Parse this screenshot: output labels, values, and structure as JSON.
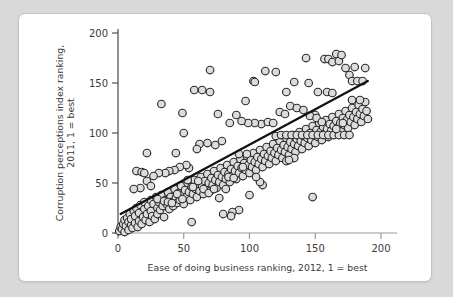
{
  "chart_data": {
    "type": "scatter",
    "title": "",
    "xlabel": "Ease of doing business ranking, 2012, 1 = best",
    "ylabel": "Corruption perceptions index ranking,\n2011, 1 = best",
    "ylabel_line1": "Corruption perceptions index ranking,",
    "ylabel_line2": "2011, 1 = best",
    "xlim": [
      0,
      200
    ],
    "ylim": [
      0,
      200
    ],
    "xticks": [
      0,
      50,
      100,
      150,
      200
    ],
    "yticks": [
      0,
      50,
      100,
      150,
      200
    ],
    "xtick_labels": [
      "0",
      "50",
      "100",
      "150",
      "200"
    ],
    "ytick_labels": [
      "0",
      "50",
      "100",
      "150",
      "200"
    ],
    "grid": false,
    "legend": "none",
    "marker": {
      "shape": "circle",
      "fill_color": "#dcdcdc",
      "edge_color": "#2b2b2b",
      "size_px": 7.6
    },
    "trendline": {
      "type": "linear-fit",
      "color": "#111111",
      "x_start": 2,
      "y_start": 19,
      "x_end": 190,
      "y_end": 152,
      "slope": 0.707,
      "intercept": 17.6
    },
    "points": [
      [
        1,
        2
      ],
      [
        2,
        6
      ],
      [
        3,
        4
      ],
      [
        4,
        9
      ],
      [
        5,
        1
      ],
      [
        5,
        13
      ],
      [
        6,
        7
      ],
      [
        7,
        15
      ],
      [
        8,
        3
      ],
      [
        8,
        11
      ],
      [
        9,
        19
      ],
      [
        10,
        8
      ],
      [
        10,
        14
      ],
      [
        11,
        5
      ],
      [
        12,
        22
      ],
      [
        13,
        10
      ],
      [
        13,
        17
      ],
      [
        14,
        25
      ],
      [
        15,
        6
      ],
      [
        16,
        12
      ],
      [
        16,
        20
      ],
      [
        17,
        28
      ],
      [
        18,
        9
      ],
      [
        19,
        16
      ],
      [
        20,
        24
      ],
      [
        20,
        31
      ],
      [
        21,
        13
      ],
      [
        22,
        19
      ],
      [
        23,
        27
      ],
      [
        24,
        11
      ],
      [
        25,
        33
      ],
      [
        25,
        22
      ],
      [
        26,
        17
      ],
      [
        27,
        29
      ],
      [
        28,
        14
      ],
      [
        29,
        36
      ],
      [
        30,
        25
      ],
      [
        30,
        19
      ],
      [
        31,
        31
      ],
      [
        32,
        23
      ],
      [
        33,
        38
      ],
      [
        34,
        27
      ],
      [
        35,
        16
      ],
      [
        36,
        33
      ],
      [
        37,
        29
      ],
      [
        38,
        41
      ],
      [
        39,
        24
      ],
      [
        40,
        36
      ],
      [
        41,
        31
      ],
      [
        42,
        27
      ],
      [
        43,
        44
      ],
      [
        44,
        35
      ],
      [
        45,
        30
      ],
      [
        46,
        40
      ],
      [
        47,
        33
      ],
      [
        48,
        47
      ],
      [
        49,
        38
      ],
      [
        50,
        29
      ],
      [
        51,
        43
      ],
      [
        52,
        36
      ],
      [
        53,
        50
      ],
      [
        54,
        41
      ],
      [
        55,
        33
      ],
      [
        56,
        46
      ],
      [
        57,
        39
      ],
      [
        58,
        53
      ],
      [
        59,
        44
      ],
      [
        60,
        36
      ],
      [
        61,
        49
      ],
      [
        62,
        42
      ],
      [
        63,
        56
      ],
      [
        64,
        47
      ],
      [
        65,
        39
      ],
      [
        66,
        52
      ],
      [
        67,
        45
      ],
      [
        68,
        59
      ],
      [
        69,
        50
      ],
      [
        70,
        42
      ],
      [
        71,
        55
      ],
      [
        72,
        48
      ],
      [
        73,
        62
      ],
      [
        74,
        53
      ],
      [
        75,
        45
      ],
      [
        76,
        58
      ],
      [
        77,
        51
      ],
      [
        78,
        65
      ],
      [
        79,
        56
      ],
      [
        80,
        48
      ],
      [
        81,
        61
      ],
      [
        82,
        54
      ],
      [
        83,
        68
      ],
      [
        84,
        59
      ],
      [
        85,
        51
      ],
      [
        86,
        64
      ],
      [
        87,
        57
      ],
      [
        88,
        71
      ],
      [
        89,
        62
      ],
      [
        90,
        54
      ],
      [
        91,
        67
      ],
      [
        92,
        60
      ],
      [
        93,
        74
      ],
      [
        94,
        65
      ],
      [
        95,
        57
      ],
      [
        96,
        70
      ],
      [
        97,
        63
      ],
      [
        98,
        77
      ],
      [
        99,
        68
      ],
      [
        100,
        60
      ],
      [
        101,
        73
      ],
      [
        102,
        66
      ],
      [
        103,
        80
      ],
      [
        104,
        71
      ],
      [
        105,
        63
      ],
      [
        106,
        76
      ],
      [
        107,
        69
      ],
      [
        108,
        83
      ],
      [
        109,
        74
      ],
      [
        110,
        66
      ],
      [
        111,
        79
      ],
      [
        112,
        72
      ],
      [
        113,
        86
      ],
      [
        114,
        77
      ],
      [
        115,
        69
      ],
      [
        116,
        82
      ],
      [
        117,
        75
      ],
      [
        118,
        89
      ],
      [
        119,
        80
      ],
      [
        120,
        72
      ],
      [
        121,
        85
      ],
      [
        122,
        78
      ],
      [
        123,
        92
      ],
      [
        124,
        83
      ],
      [
        125,
        75
      ],
      [
        126,
        88
      ],
      [
        127,
        81
      ],
      [
        128,
        95
      ],
      [
        129,
        86
      ],
      [
        130,
        78
      ],
      [
        131,
        91
      ],
      [
        132,
        84
      ],
      [
        133,
        98
      ],
      [
        134,
        89
      ],
      [
        135,
        81
      ],
      [
        136,
        94
      ],
      [
        137,
        87
      ],
      [
        138,
        101
      ],
      [
        139,
        92
      ],
      [
        140,
        84
      ],
      [
        141,
        97
      ],
      [
        142,
        90
      ],
      [
        143,
        104
      ],
      [
        144,
        95
      ],
      [
        145,
        87
      ],
      [
        146,
        100
      ],
      [
        147,
        93
      ],
      [
        148,
        107
      ],
      [
        149,
        98
      ],
      [
        150,
        90
      ],
      [
        151,
        103
      ],
      [
        152,
        96
      ],
      [
        153,
        110
      ],
      [
        154,
        101
      ],
      [
        155,
        93
      ],
      [
        156,
        106
      ],
      [
        157,
        99
      ],
      [
        158,
        113
      ],
      [
        159,
        104
      ],
      [
        160,
        96
      ],
      [
        161,
        109
      ],
      [
        162,
        102
      ],
      [
        163,
        116
      ],
      [
        164,
        107
      ],
      [
        165,
        99
      ],
      [
        166,
        112
      ],
      [
        167,
        105
      ],
      [
        168,
        119
      ],
      [
        169,
        110
      ],
      [
        170,
        102
      ],
      [
        171,
        115
      ],
      [
        172,
        108
      ],
      [
        173,
        122
      ],
      [
        174,
        113
      ],
      [
        175,
        105
      ],
      [
        176,
        118
      ],
      [
        177,
        111
      ],
      [
        178,
        125
      ],
      [
        179,
        116
      ],
      [
        180,
        108
      ],
      [
        181,
        121
      ],
      [
        182,
        114
      ],
      [
        183,
        128
      ],
      [
        184,
        119
      ],
      [
        185,
        111
      ],
      [
        186,
        124
      ],
      [
        187,
        117
      ],
      [
        188,
        131
      ],
      [
        189,
        122
      ],
      [
        190,
        114
      ],
      [
        33,
        129
      ],
      [
        49,
        120
      ],
      [
        50,
        100
      ],
      [
        22,
        80
      ],
      [
        44,
        80
      ],
      [
        56,
        11
      ],
      [
        58,
        143
      ],
      [
        70,
        163
      ],
      [
        64,
        143
      ],
      [
        70,
        141
      ],
      [
        76,
        119
      ],
      [
        85,
        110
      ],
      [
        90,
        118
      ],
      [
        97,
        132
      ],
      [
        103,
        152
      ],
      [
        104,
        151
      ],
      [
        112,
        162
      ],
      [
        120,
        161
      ],
      [
        128,
        141
      ],
      [
        134,
        151
      ],
      [
        143,
        175
      ],
      [
        145,
        150
      ],
      [
        152,
        141
      ],
      [
        157,
        174
      ],
      [
        160,
        174
      ],
      [
        163,
        171
      ],
      [
        166,
        179
      ],
      [
        168,
        172
      ],
      [
        170,
        178
      ],
      [
        173,
        165
      ],
      [
        176,
        158
      ],
      [
        178,
        152
      ],
      [
        180,
        166
      ],
      [
        182,
        152
      ],
      [
        184,
        133
      ],
      [
        178,
        133
      ],
      [
        188,
        165
      ],
      [
        186,
        152
      ],
      [
        159,
        141
      ],
      [
        163,
        140
      ],
      [
        150,
        118
      ],
      [
        148,
        36
      ],
      [
        134,
        75
      ],
      [
        128,
        72
      ],
      [
        130,
        73
      ],
      [
        120,
        97
      ],
      [
        124,
        98
      ],
      [
        128,
        98
      ],
      [
        132,
        98
      ],
      [
        136,
        98
      ],
      [
        140,
        98
      ],
      [
        144,
        98
      ],
      [
        148,
        98
      ],
      [
        152,
        98
      ],
      [
        156,
        98
      ],
      [
        160,
        98
      ],
      [
        164,
        98
      ],
      [
        168,
        98
      ],
      [
        172,
        98
      ],
      [
        176,
        98
      ],
      [
        110,
        48
      ],
      [
        108,
        51
      ],
      [
        105,
        56
      ],
      [
        100,
        38
      ],
      [
        92,
        23
      ],
      [
        87,
        21
      ],
      [
        86,
        17
      ],
      [
        80,
        19
      ],
      [
        77,
        35
      ],
      [
        82,
        44
      ],
      [
        84,
        56
      ],
      [
        88,
        55
      ],
      [
        95,
        66
      ],
      [
        98,
        79
      ],
      [
        92,
        79
      ],
      [
        79,
        92
      ],
      [
        74,
        88
      ],
      [
        68,
        90
      ],
      [
        62,
        89
      ],
      [
        60,
        84
      ],
      [
        54,
        65
      ],
      [
        52,
        68
      ],
      [
        47,
        66
      ],
      [
        43,
        63
      ],
      [
        39,
        62
      ],
      [
        36,
        60
      ],
      [
        31,
        60
      ],
      [
        27,
        57
      ],
      [
        22,
        52
      ],
      [
        17,
        45
      ],
      [
        12,
        44
      ],
      [
        14,
        62
      ],
      [
        18,
        61
      ],
      [
        20,
        60
      ],
      [
        25,
        47
      ],
      [
        30,
        34
      ],
      [
        35,
        32
      ],
      [
        38,
        31
      ],
      [
        41,
        30
      ],
      [
        45,
        39
      ],
      [
        49,
        34
      ],
      [
        53,
        53
      ],
      [
        57,
        46
      ],
      [
        61,
        52
      ],
      [
        65,
        44
      ],
      [
        69,
        40
      ],
      [
        73,
        44
      ],
      [
        109,
        109
      ],
      [
        114,
        111
      ],
      [
        118,
        110
      ],
      [
        123,
        121
      ],
      [
        127,
        119
      ],
      [
        131,
        127
      ],
      [
        136,
        125
      ],
      [
        141,
        123
      ],
      [
        146,
        117
      ],
      [
        151,
        115
      ],
      [
        155,
        111
      ],
      [
        171,
        110
      ],
      [
        166,
        104
      ],
      [
        104,
        110
      ],
      [
        99,
        110
      ],
      [
        94,
        112
      ]
    ]
  },
  "figure": {
    "background_color": "#ffffff",
    "page_background_color": "#d9d9d9",
    "border_color": "#c2c2c2"
  }
}
